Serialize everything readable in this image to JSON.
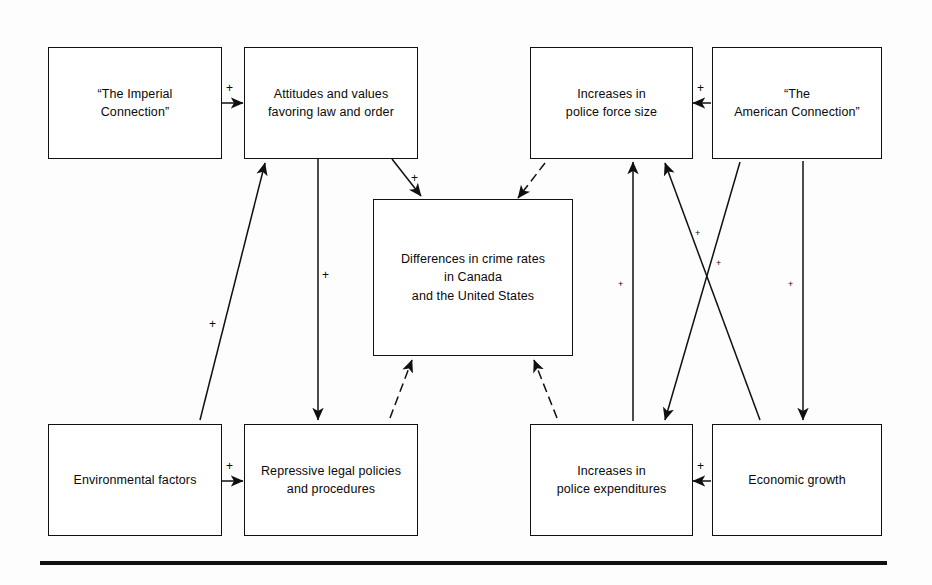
{
  "diagram": {
    "nodes": [
      {
        "id": "imperial",
        "label": "“The Imperial\nConnection”"
      },
      {
        "id": "attitudes",
        "label": "Attitudes and values\nfavoring law and order"
      },
      {
        "id": "policeforce",
        "label": "Increases in\npolice force size"
      },
      {
        "id": "american",
        "label": "“The\nAmerican Connection”"
      },
      {
        "id": "crimerates",
        "label": "Differences in crime rates\nin Canada\nand the United States"
      },
      {
        "id": "environment",
        "label": "Environmental factors"
      },
      {
        "id": "repressive",
        "label": "Repressive legal policies\nand procedures"
      },
      {
        "id": "expenditures",
        "label": "Increases in\npolice expenditures"
      },
      {
        "id": "economic",
        "label": "Economic growth"
      }
    ],
    "edges": [
      {
        "from": "imperial",
        "to": "attitudes",
        "sign": "+",
        "style": "solid"
      },
      {
        "from": "american",
        "to": "policeforce",
        "sign": "+",
        "style": "solid"
      },
      {
        "from": "environment",
        "to": "repressive",
        "sign": "+",
        "style": "solid"
      },
      {
        "from": "economic",
        "to": "expenditures",
        "sign": "+",
        "style": "solid"
      },
      {
        "from": "attitudes",
        "to": "crimerates",
        "sign": "+",
        "style": "solid"
      },
      {
        "from": "attitudes",
        "to": "repressive",
        "sign": "+",
        "style": "solid"
      },
      {
        "from": "environment",
        "to": "attitudes",
        "sign": "+",
        "style": "solid"
      },
      {
        "from": "policeforce",
        "to": "crimerates",
        "sign": "",
        "style": "dashed"
      },
      {
        "from": "repressive",
        "to": "crimerates",
        "sign": "",
        "style": "dashed"
      },
      {
        "from": "expenditures",
        "to": "crimerates",
        "sign": "",
        "style": "dashed"
      },
      {
        "from": "expenditures",
        "to": "policeforce",
        "sign": "+",
        "style": "solid"
      },
      {
        "from": "economic",
        "to": "policeforce",
        "sign": "+",
        "style": "solid"
      },
      {
        "from": "policeforce",
        "to": "expenditures",
        "sign": "+",
        "style": "solid"
      },
      {
        "from": "american",
        "to": "economic",
        "sign": "+",
        "style": "solid"
      }
    ],
    "signs": [
      {
        "id": "sign-imperial-attitudes",
        "text": "+"
      },
      {
        "id": "sign-american-policeforce",
        "text": "+"
      },
      {
        "id": "sign-environment-repressive",
        "text": "+"
      },
      {
        "id": "sign-economic-expenditures",
        "text": "+"
      },
      {
        "id": "sign-attitudes-crimerates",
        "text": "+"
      },
      {
        "id": "sign-attitudes-repressive",
        "text": "+"
      },
      {
        "id": "sign-environment-attitudes",
        "text": "+"
      },
      {
        "id": "sign-expenditures-policeforce",
        "text": "+"
      },
      {
        "id": "sign-economic-policeforce",
        "text": "+"
      },
      {
        "id": "sign-policeforce-expenditures",
        "text": "+"
      },
      {
        "id": "sign-american-economic",
        "text": "+"
      }
    ]
  }
}
